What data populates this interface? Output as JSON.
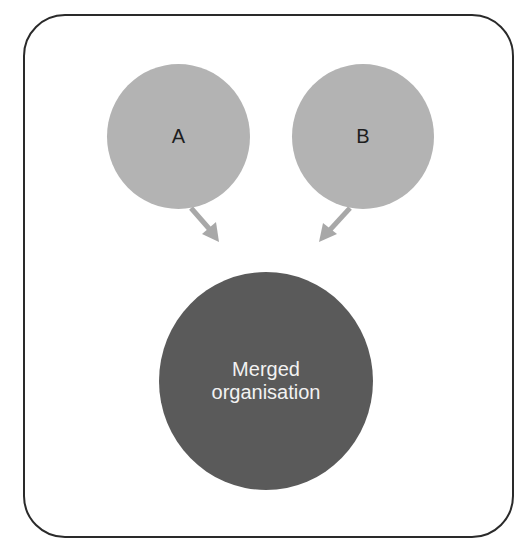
{
  "diagram": {
    "type": "merger",
    "nodes": {
      "a": {
        "label": "A",
        "color": "#b3b3b3"
      },
      "b": {
        "label": "B",
        "color": "#b3b3b3"
      },
      "merged": {
        "line1": "Merged",
        "line2": "organisation",
        "color": "#5a5a5a"
      }
    },
    "edges": [
      {
        "from": "A",
        "to": "Merged organisation"
      },
      {
        "from": "B",
        "to": "Merged organisation"
      }
    ],
    "arrow_color": "#a8a8a8",
    "frame_color": "#2a2a2a"
  }
}
